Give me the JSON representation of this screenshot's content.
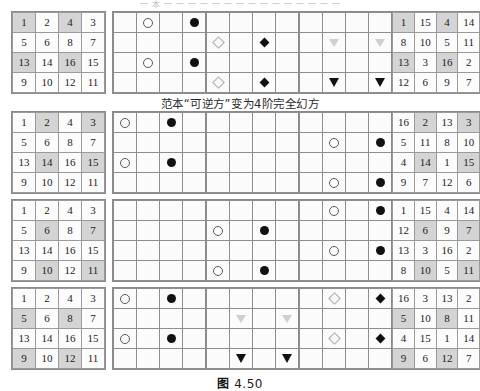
{
  "document": {
    "top_partial_text": "一 本 一 一 一 一 一 一 一 一 一 一 一 一 一 一 一",
    "middle_caption": "范本“可逆方”变为4阶完全幻方",
    "figure_caption_label": "图",
    "figure_caption_number": "4.50"
  },
  "layout": {
    "columns": 5,
    "rows": 4,
    "grid_size": "4x4",
    "shade_color": "#d4d4d4",
    "cell_border_color": "#9a9a9a"
  },
  "rows": [
    {
      "id": "row-1",
      "grids": [
        {
          "id": "row1-numbers-left",
          "type": "numbers",
          "values": [
            [
              1,
              2,
              4,
              3
            ],
            [
              5,
              6,
              8,
              7
            ],
            [
              13,
              14,
              16,
              15
            ],
            [
              9,
              10,
              12,
              11
            ]
          ],
          "shaded": [
            [
              1,
              1
            ],
            [
              1,
              3
            ],
            [
              3,
              1
            ],
            [
              3,
              3
            ]
          ]
        },
        {
          "id": "row1-markers-circles",
          "type": "markers",
          "marks": [
            {
              "r": 1,
              "c": 2,
              "glyph": "circle-open"
            },
            {
              "r": 1,
              "c": 4,
              "glyph": "circle-fill"
            },
            {
              "r": 3,
              "c": 2,
              "glyph": "circle-open"
            },
            {
              "r": 3,
              "c": 4,
              "glyph": "circle-fill"
            }
          ]
        },
        {
          "id": "row1-markers-diamonds",
          "type": "markers",
          "marks": [
            {
              "r": 2,
              "c": 1,
              "glyph": "diamond-open"
            },
            {
              "r": 2,
              "c": 3,
              "glyph": "diamond-fill"
            },
            {
              "r": 4,
              "c": 1,
              "glyph": "diamond-open"
            },
            {
              "r": 4,
              "c": 3,
              "glyph": "diamond-fill"
            }
          ]
        },
        {
          "id": "row1-markers-triangles",
          "type": "markers",
          "marks": [
            {
              "r": 2,
              "c": 2,
              "glyph": "triangle-open"
            },
            {
              "r": 2,
              "c": 4,
              "glyph": "triangle-open"
            },
            {
              "r": 4,
              "c": 2,
              "glyph": "triangle-fill"
            },
            {
              "r": 4,
              "c": 4,
              "glyph": "triangle-fill"
            }
          ]
        },
        {
          "id": "row1-numbers-right",
          "type": "numbers",
          "values": [
            [
              1,
              15,
              4,
              14
            ],
            [
              8,
              10,
              5,
              11
            ],
            [
              13,
              3,
              16,
              2
            ],
            [
              12,
              6,
              9,
              7
            ]
          ],
          "shaded": [
            [
              1,
              1
            ],
            [
              1,
              3
            ],
            [
              3,
              1
            ],
            [
              3,
              3
            ]
          ]
        }
      ]
    },
    {
      "id": "row-2",
      "grids": [
        {
          "id": "row2-numbers-left",
          "type": "numbers",
          "values": [
            [
              1,
              2,
              4,
              3
            ],
            [
              5,
              6,
              8,
              7
            ],
            [
              13,
              14,
              16,
              15
            ],
            [
              9,
              10,
              12,
              11
            ]
          ],
          "shaded": [
            [
              1,
              2
            ],
            [
              1,
              4
            ],
            [
              3,
              2
            ],
            [
              3,
              4
            ]
          ]
        },
        {
          "id": "row2-markers-circles",
          "type": "markers",
          "marks": [
            {
              "r": 1,
              "c": 1,
              "glyph": "circle-open"
            },
            {
              "r": 1,
              "c": 3,
              "glyph": "circle-fill"
            },
            {
              "r": 3,
              "c": 1,
              "glyph": "circle-open"
            },
            {
              "r": 3,
              "c": 3,
              "glyph": "circle-fill"
            }
          ]
        },
        {
          "id": "row2-markers-empty",
          "type": "markers",
          "marks": []
        },
        {
          "id": "row2-markers-circles-2",
          "type": "markers",
          "marks": [
            {
              "r": 2,
              "c": 2,
              "glyph": "circle-open"
            },
            {
              "r": 2,
              "c": 4,
              "glyph": "circle-fill"
            },
            {
              "r": 4,
              "c": 2,
              "glyph": "circle-open"
            },
            {
              "r": 4,
              "c": 4,
              "glyph": "circle-fill"
            }
          ]
        },
        {
          "id": "row2-numbers-right",
          "type": "numbers",
          "values": [
            [
              16,
              2,
              13,
              3
            ],
            [
              5,
              11,
              8,
              10
            ],
            [
              4,
              14,
              1,
              15
            ],
            [
              9,
              7,
              12,
              6
            ]
          ],
          "shaded": [
            [
              1,
              2
            ],
            [
              1,
              4
            ],
            [
              3,
              2
            ],
            [
              3,
              4
            ]
          ]
        }
      ]
    },
    {
      "id": "row-3",
      "grids": [
        {
          "id": "row3-numbers-left",
          "type": "numbers",
          "values": [
            [
              1,
              2,
              4,
              3
            ],
            [
              5,
              6,
              8,
              7
            ],
            [
              13,
              14,
              16,
              15
            ],
            [
              9,
              10,
              12,
              11
            ]
          ],
          "shaded": [
            [
              2,
              2
            ],
            [
              2,
              4
            ],
            [
              4,
              2
            ],
            [
              4,
              4
            ]
          ]
        },
        {
          "id": "row3-markers-empty",
          "type": "markers",
          "marks": []
        },
        {
          "id": "row3-markers-circles",
          "type": "markers",
          "marks": [
            {
              "r": 2,
              "c": 1,
              "glyph": "circle-open"
            },
            {
              "r": 2,
              "c": 3,
              "glyph": "circle-fill"
            },
            {
              "r": 4,
              "c": 1,
              "glyph": "circle-open"
            },
            {
              "r": 4,
              "c": 3,
              "glyph": "circle-fill"
            }
          ]
        },
        {
          "id": "row3-markers-circles-2",
          "type": "markers",
          "marks": [
            {
              "r": 1,
              "c": 2,
              "glyph": "circle-open"
            },
            {
              "r": 1,
              "c": 4,
              "glyph": "circle-fill"
            },
            {
              "r": 3,
              "c": 2,
              "glyph": "circle-open"
            },
            {
              "r": 3,
              "c": 4,
              "glyph": "circle-fill"
            }
          ]
        },
        {
          "id": "row3-numbers-right",
          "type": "numbers",
          "values": [
            [
              1,
              15,
              4,
              14
            ],
            [
              12,
              6,
              9,
              7
            ],
            [
              13,
              3,
              16,
              2
            ],
            [
              8,
              10,
              5,
              11
            ]
          ],
          "shaded": [
            [
              2,
              2
            ],
            [
              2,
              4
            ],
            [
              4,
              2
            ],
            [
              4,
              4
            ]
          ]
        }
      ]
    },
    {
      "id": "row-4",
      "grids": [
        {
          "id": "row4-numbers-left",
          "type": "numbers",
          "values": [
            [
              1,
              2,
              4,
              3
            ],
            [
              5,
              6,
              8,
              7
            ],
            [
              13,
              14,
              16,
              15
            ],
            [
              9,
              10,
              12,
              11
            ]
          ],
          "shaded": [
            [
              2,
              1
            ],
            [
              2,
              3
            ],
            [
              4,
              1
            ],
            [
              4,
              3
            ]
          ]
        },
        {
          "id": "row4-markers-circles",
          "type": "markers",
          "marks": [
            {
              "r": 1,
              "c": 1,
              "glyph": "circle-open"
            },
            {
              "r": 1,
              "c": 3,
              "glyph": "circle-fill"
            },
            {
              "r": 3,
              "c": 1,
              "glyph": "circle-open"
            },
            {
              "r": 3,
              "c": 3,
              "glyph": "circle-fill"
            }
          ]
        },
        {
          "id": "row4-markers-triangles",
          "type": "markers",
          "marks": [
            {
              "r": 2,
              "c": 2,
              "glyph": "triangle-open"
            },
            {
              "r": 2,
              "c": 4,
              "glyph": "triangle-open"
            },
            {
              "r": 4,
              "c": 2,
              "glyph": "triangle-fill"
            },
            {
              "r": 4,
              "c": 4,
              "glyph": "triangle-fill"
            }
          ]
        },
        {
          "id": "row4-markers-diamonds",
          "type": "markers",
          "marks": [
            {
              "r": 1,
              "c": 2,
              "glyph": "diamond-open"
            },
            {
              "r": 1,
              "c": 4,
              "glyph": "diamond-fill"
            },
            {
              "r": 3,
              "c": 2,
              "glyph": "diamond-open"
            },
            {
              "r": 3,
              "c": 4,
              "glyph": "diamond-fill"
            }
          ]
        },
        {
          "id": "row4-numbers-right",
          "type": "numbers",
          "values": [
            [
              16,
              3,
              13,
              2
            ],
            [
              5,
              10,
              8,
              11
            ],
            [
              4,
              15,
              1,
              14
            ],
            [
              9,
              6,
              12,
              7
            ]
          ],
          "shaded": [
            [
              2,
              1
            ],
            [
              2,
              3
            ],
            [
              4,
              1
            ],
            [
              4,
              3
            ]
          ]
        }
      ]
    }
  ]
}
